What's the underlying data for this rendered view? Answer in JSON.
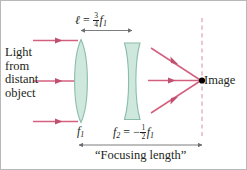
{
  "figure": {
    "width": 247,
    "height": 170,
    "background": "#ffffff"
  },
  "colors": {
    "ray": "#d4607f",
    "ray_dark": "#c0506f",
    "lens_fill": "#cfe8dd",
    "lens_stroke": "#7fb3a0",
    "dimension_line": "#6d6e71",
    "text": "#231f20",
    "axis_dash": "#e2a0b4",
    "image_dot": "#000000"
  },
  "labels": {
    "light_source": {
      "lines": [
        "Light",
        "from",
        "distant",
        "object"
      ],
      "text": "Light from distant object"
    },
    "image": "Image",
    "focusing_length": "“Focusing length”",
    "separation": {
      "symbol": "ℓ",
      "equals": "=",
      "numerator": "3",
      "denominator": "4",
      "variable": "f",
      "subscript": "1",
      "text": "ℓ = 3/4 f1"
    },
    "lens1_focal": {
      "variable": "f",
      "subscript": "1",
      "text": "f1"
    },
    "lens2_focal": {
      "variable": "f",
      "subscript": "2",
      "equals": "=",
      "sign": "−",
      "numerator": "1",
      "denominator": "2",
      "variable2": "f",
      "subscript2": "1",
      "text": "f2 = -1/2 f1"
    }
  },
  "elements": {
    "lens1": {
      "type": "converging-biconvex",
      "name": "objective lens"
    },
    "lens2": {
      "type": "diverging-biconcave",
      "name": "negative lens"
    },
    "incoming_rays": 3,
    "outgoing_rays": 3,
    "image_plane": "vertical dashed line"
  }
}
